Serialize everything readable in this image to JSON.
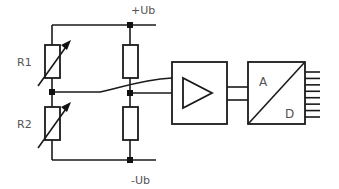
{
  "diagram": {
    "supply_positive": "+Ub",
    "supply_negative": "-Ub",
    "components": {
      "r1": {
        "label": "R1",
        "type": "variable-resistor"
      },
      "r2": {
        "label": "R2",
        "type": "variable-resistor"
      },
      "r3": {
        "label": "",
        "type": "fixed-resistor"
      },
      "r4": {
        "label": "",
        "type": "fixed-resistor"
      },
      "amplifier": {
        "label": "",
        "type": "amplifier"
      },
      "adc": {
        "label_analog": "A",
        "label_digital": "D",
        "type": "analog-to-digital-converter",
        "output_bits": 8
      }
    }
  }
}
